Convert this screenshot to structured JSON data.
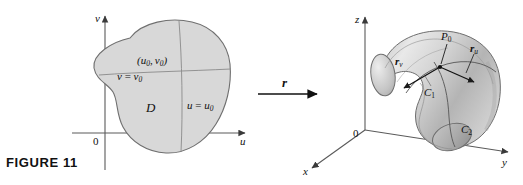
{
  "figure": {
    "caption": "FIGURE 11",
    "number": "11"
  },
  "map_arrow": {
    "label": "r",
    "name": "vector-function-r"
  },
  "left_panel": {
    "name": "uv-parameter-domain",
    "axes": {
      "horizontal_label": "u",
      "vertical_label": "v",
      "origin_label": "0"
    },
    "region_label": "D",
    "point_label_prefix": "(",
    "point_label": "(u₀, v₀)",
    "point_u": "u",
    "point_u_sub": "0",
    "point_v": "v",
    "point_v_sub": "0",
    "gridline_v": {
      "lhs": "v",
      "eq": " = ",
      "rhs": "v",
      "rhs_sub": "0",
      "full": "v = v₀"
    },
    "gridline_u": {
      "lhs": "u",
      "eq": " = ",
      "rhs": "u",
      "rhs_sub": "0",
      "full": "u = u₀"
    }
  },
  "right_panel": {
    "name": "xyz-surface-image",
    "axes": {
      "x_label": "x",
      "y_label": "y",
      "z_label": "z",
      "origin_label": "0"
    },
    "point_label": "P",
    "point_sub": "0",
    "tangent_v": {
      "base": "r",
      "sub": "v"
    },
    "tangent_u": {
      "base": "r",
      "sub": "u"
    },
    "curve_1": {
      "base": "C",
      "sub": "1"
    },
    "curve_2": {
      "base": "C",
      "sub": "2"
    }
  },
  "colors": {
    "region_fill": "#d8d8d8",
    "region_stroke": "#6b6b6b",
    "axis": "#5a5a5a",
    "surface_light": "#e6e6e6",
    "surface_mid": "#c9c9c9",
    "surface_dark": "#9d9d9d",
    "ink": "#111111"
  }
}
